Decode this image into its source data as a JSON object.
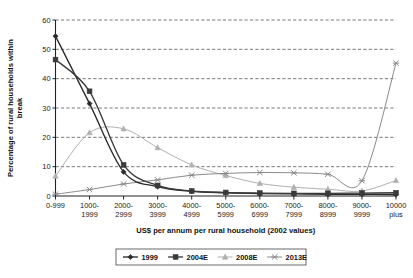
{
  "chart_data": {
    "type": "line",
    "title": "",
    "xlabel": "US$ per annum per rural household (2002 values)",
    "ylabel_line1": "Percentage of rural households within",
    "ylabel_line2": "break",
    "categories": [
      "0-999",
      "1000-\n1999",
      "2000-\n2999",
      "3000-\n3999",
      "4000-\n4999",
      "5000-\n5999",
      "6000-\n6999",
      "7000-\n7999",
      "8000-\n8999",
      "9000-\n9999",
      "10000\nplus"
    ],
    "category_lines": [
      [
        "0-999",
        ""
      ],
      [
        "1000-",
        "1999"
      ],
      [
        "2000-",
        "2999"
      ],
      [
        "3000-",
        "3999"
      ],
      [
        "4000-",
        "4999"
      ],
      [
        "5000-",
        "5999"
      ],
      [
        "6000-",
        "6999"
      ],
      [
        "7000-",
        "7999"
      ],
      [
        "8000-",
        "8999"
      ],
      [
        "9000-",
        "9999"
      ],
      [
        "10000",
        "plus"
      ]
    ],
    "ylim": [
      0,
      60
    ],
    "yticks": [
      0,
      10,
      20,
      30,
      40,
      50,
      60
    ],
    "ytick_labels": [
      "0",
      "10",
      "20",
      "30",
      "40",
      "50",
      "60"
    ],
    "grid": true,
    "grid_style": "dashed-horizontal",
    "legend_position": "bottom",
    "series": [
      {
        "name": "1999",
        "marker": "diamond",
        "color": "#2b2b2b",
        "values": [
          54.5,
          31.5,
          8.2,
          3.2,
          1.6,
          1.1,
          0.8,
          0.7,
          0.6,
          0.6,
          0.5
        ]
      },
      {
        "name": "2004E",
        "marker": "square",
        "color": "#3a3a3a",
        "values": [
          46.5,
          35.7,
          10.6,
          3.6,
          1.7,
          1.2,
          1.0,
          0.9,
          0.9,
          1.0,
          1.1
        ]
      },
      {
        "name": "2008E",
        "marker": "triangle",
        "color": "#b0b0b0",
        "values": [
          6.8,
          21.6,
          22.9,
          16.5,
          10.6,
          7.0,
          4.3,
          3.0,
          2.3,
          1.7,
          5.3
        ]
      },
      {
        "name": "2013E",
        "marker": "cross",
        "color": "#8a8a8a",
        "values": [
          0.6,
          2.2,
          4.1,
          5.5,
          7.1,
          7.7,
          8.0,
          7.9,
          7.4,
          5.2,
          45.3
        ]
      }
    ]
  }
}
